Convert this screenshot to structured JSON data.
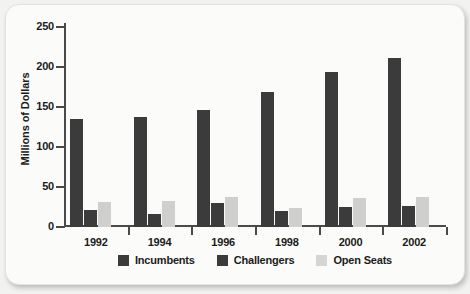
{
  "chart_data": {
    "type": "bar",
    "title": "",
    "xlabel": "",
    "ylabel": "Millions of Dollars",
    "ylim": [
      0,
      250
    ],
    "yticks": [
      250,
      200,
      150,
      100,
      50,
      0
    ],
    "grid": false,
    "legend_position": "bottom",
    "categories": [
      "1992",
      "1994",
      "1996",
      "1998",
      "2000",
      "2002"
    ],
    "series": [
      {
        "name": "Incumbents",
        "color": "#3b3b3b",
        "values": [
          135,
          137,
          146,
          169,
          194,
          211
        ]
      },
      {
        "name": "Challengers",
        "color": "#3b3b3b",
        "values": [
          21,
          16,
          30,
          20,
          25,
          26
        ]
      },
      {
        "name": "Open Seats",
        "color": "#cfcfcd",
        "values": [
          31,
          33,
          38,
          24,
          36,
          38
        ]
      }
    ]
  },
  "axis": {
    "y_label": "Millions of Dollars",
    "y_tick_labels": [
      "250",
      "200",
      "150",
      "100",
      "50",
      "0"
    ],
    "x_tick_labels": [
      "1992",
      "1994",
      "1996",
      "1998",
      "2000",
      "2002"
    ]
  },
  "legend": {
    "items": [
      {
        "label": "Incumbents",
        "swatch": "dark"
      },
      {
        "label": "Challengers",
        "swatch": "dark"
      },
      {
        "label": "Open Seats",
        "swatch": "light"
      }
    ]
  },
  "colors": {
    "bar_dark": "#3b3b3b",
    "bar_light": "#cfcfcd",
    "axis": "#4a4a4a",
    "card_background": "#fbfbfa",
    "page_background": "#f2f2f0"
  }
}
